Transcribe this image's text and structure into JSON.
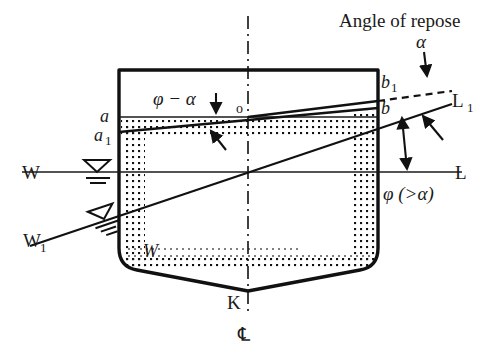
{
  "figure": {
    "title": "Angle of repose",
    "colors": {
      "ink": "#111111",
      "background": "#ffffff",
      "cargo_dots": "#111111"
    }
  },
  "labels": {
    "angle_of_repose": "Angle of repose",
    "alpha": "α",
    "phi_minus_alpha": "φ − α",
    "phi_greater_alpha": "φ (>α)",
    "origin_o": "o",
    "cargo_surface_left": "a",
    "cargo_surface_left_shifted": "a",
    "cargo_surface_left_shifted_sub": "1",
    "cargo_surface_right": "b",
    "cargo_surface_right_repose": "b",
    "cargo_surface_right_repose_sub": "1",
    "waterline_port": "W",
    "waterline_starboard": "L",
    "heeled_waterline_port": "W",
    "heeled_waterline_port_sub": "1",
    "heeled_waterline_starboard": "L",
    "heeled_waterline_starboard_sub": "1",
    "keel": "K",
    "centerline_symbol": "℄",
    "cargo_mass": "W"
  },
  "annotations": [
    {
      "name": "angle-of-repose-callout",
      "text": "Angle of repose",
      "points_to": "dashed-repose-line"
    },
    {
      "name": "alpha-callout",
      "text": "α",
      "points_to": "dashed-repose-line"
    },
    {
      "name": "phi-minus-alpha-callout",
      "text": "φ − α",
      "points_to": "shifted-cargo-surface"
    },
    {
      "name": "phi-angle-callout",
      "text": "φ (>α)",
      "points_to": "heel-angle-arrow"
    }
  ],
  "geometry": {
    "hull": {
      "top_y": 70,
      "left_x": 119,
      "right_x": 378,
      "keel_y": 291,
      "bilge_y": 266
    },
    "waterlines": {
      "upright": {
        "y": 172,
        "x_start": 22,
        "x_end": 462
      },
      "heeled": {
        "x1": 30,
        "y1": 244,
        "x2": 452,
        "y2": 102
      }
    },
    "cargo_surface": {
      "upright_y": 117,
      "shifted": {
        "x1": 119,
        "y1": 128,
        "x2": 378,
        "y2": 108
      },
      "repose": {
        "x1": 119,
        "y1": 133,
        "x2": 452,
        "y2": 91
      }
    },
    "centerline_x": 248
  }
}
